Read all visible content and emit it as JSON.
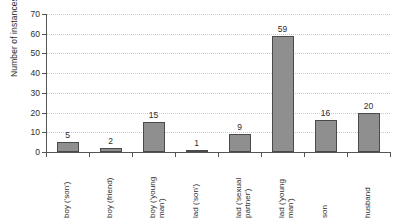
{
  "chart_data": {
    "type": "bar",
    "title": "",
    "xlabel": "",
    "ylabel": "Number of instances",
    "ylim": [
      0,
      70
    ],
    "ytick_step": 10,
    "yticks": [
      0,
      10,
      20,
      30,
      40,
      50,
      60,
      70
    ],
    "grid": true,
    "legend": "none",
    "categories": [
      "boy ('son')",
      "boy (friend)",
      "boy ('young\nman')",
      "lad ('son')",
      "lad ('sexual\npartner')",
      "lad ('young\nman')",
      "son",
      "husband"
    ],
    "values": [
      5,
      2,
      15,
      1,
      9,
      59,
      16,
      20
    ],
    "value_labels": [
      "5",
      "2",
      "15",
      "1",
      "9",
      "59",
      "16",
      "20"
    ],
    "bar_color": "#8f8f8f",
    "bar_edge_color": "#4a4a4a",
    "grid_color": "#c9c9c9",
    "axis_color": "#555555",
    "background": "#ffffff"
  }
}
